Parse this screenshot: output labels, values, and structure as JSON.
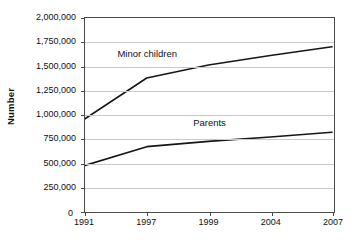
{
  "chart_data": {
    "type": "line",
    "title": "",
    "subtitle": "",
    "xlabel": "",
    "ylabel": "Number",
    "categories": [
      "1991",
      "1997",
      "1999",
      "2004",
      "2007"
    ],
    "x_axis_type": "categorical",
    "ylim": [
      0,
      2000000
    ],
    "y_tick_step": 250000,
    "y_ticks": [
      0,
      250000,
      500000,
      750000,
      1000000,
      1250000,
      1500000,
      1750000,
      2000000
    ],
    "y_tick_labels": [
      "0",
      "250,000",
      "500,000",
      "750,000",
      "1,000,000",
      "1,250,000",
      "1,500,000",
      "1,750,000",
      "2,000,000"
    ],
    "grid": "horizontal",
    "legend_position": "inline-annotation",
    "series": [
      {
        "name": "Minor children",
        "values": [
          950000,
          1375000,
          1510000,
          1610000,
          1700000
        ],
        "color": "#161616",
        "label_x_category_index": 1,
        "label_value": 1640000
      },
      {
        "name": "Parents",
        "values": [
          465000,
          660000,
          715000,
          760000,
          810000
        ],
        "color": "#161616",
        "label_x_category_index": 2,
        "label_value": 930000
      }
    ],
    "annotations": [
      {
        "text": "Minor children",
        "series": "Minor children"
      },
      {
        "text": "Parents",
        "series": "Parents"
      }
    ]
  },
  "axes": {
    "y_title": "Number",
    "zero_label": "0"
  },
  "colors": {
    "background": "#ffffff",
    "axis": "#4a4a4a",
    "gridline": "#c9c9c9",
    "series_line": "#161616",
    "text": "#111111"
  }
}
